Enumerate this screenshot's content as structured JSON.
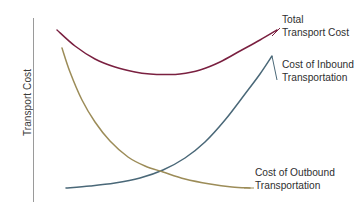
{
  "chart_data": {
    "type": "line",
    "title": "",
    "subtitle": "",
    "xlabel": "",
    "ylabel": "Transport Cost",
    "grid": false,
    "legend_position": "right-inline-annotations",
    "axes": {
      "y_axis_visible": true,
      "x_axis_visible": false,
      "y_tick_labels": [],
      "x_tick_labels": [],
      "y_axis_color": "#9a9a9a"
    },
    "annotations": [
      {
        "id": "total",
        "line1": "Total",
        "line2": "Transport Cost",
        "color": "#7a2040"
      },
      {
        "id": "inbound",
        "line1": "Cost of Inbound",
        "line2": "Transportation",
        "color": "#4a6878"
      },
      {
        "id": "outbound",
        "line1": "Cost of Outbound",
        "line2": "Transportation",
        "color": "#9c8c58"
      }
    ],
    "series": [
      {
        "name": "Total Transport Cost",
        "color": "#7a2040",
        "shape": "u-curve-convex",
        "points": [
          [
            57,
            30
          ],
          [
            75,
            46
          ],
          [
            95,
            59
          ],
          [
            115,
            67
          ],
          [
            135,
            72
          ],
          [
            150,
            74
          ],
          [
            165,
            74.5
          ],
          [
            180,
            74
          ],
          [
            200,
            70
          ],
          [
            220,
            62
          ],
          [
            240,
            51
          ],
          [
            260,
            40
          ],
          [
            277,
            30
          ]
        ]
      },
      {
        "name": "Cost of Inbound Transportation",
        "color": "#4a6878",
        "shape": "increasing-convex",
        "points": [
          [
            66,
            188
          ],
          [
            90,
            186
          ],
          [
            115,
            183
          ],
          [
            140,
            178
          ],
          [
            163,
            170
          ],
          [
            185,
            158
          ],
          [
            205,
            142
          ],
          [
            225,
            120
          ],
          [
            245,
            94
          ],
          [
            260,
            74
          ],
          [
            272,
            56
          ]
        ]
      },
      {
        "name": "Cost of Outbound Transportation",
        "color": "#9c8c58",
        "shape": "decreasing-convex",
        "points": [
          [
            62,
            48
          ],
          [
            70,
            72
          ],
          [
            82,
            100
          ],
          [
            95,
            122
          ],
          [
            110,
            141
          ],
          [
            128,
            157
          ],
          [
            145,
            166
          ],
          [
            163,
            172
          ],
          [
            185,
            179
          ],
          [
            210,
            184
          ],
          [
            232,
            187
          ],
          [
            250,
            188
          ]
        ]
      }
    ]
  },
  "yaxis": {
    "label": "Transport Cost"
  },
  "labels": {
    "total": {
      "line1": "Total",
      "line2": "Transport Cost"
    },
    "inbound": {
      "line1": "Cost of Inbound",
      "line2": "Transportation"
    },
    "outbound": {
      "line1": "Cost of Outbound",
      "line2": "Transportation"
    }
  }
}
